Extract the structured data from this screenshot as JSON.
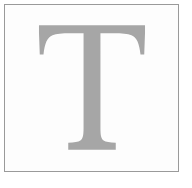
{
  "image": {
    "kind": "letter-specimen",
    "width": 192,
    "height": 188,
    "background_color": "#ffffff"
  },
  "frame": {
    "name": "border-frame",
    "border_color": "#9a9a9a",
    "border_width": 1,
    "fill_color": "#fdfdfd",
    "left": 4,
    "top": 4,
    "width": 175,
    "height": 168
  },
  "glyph": {
    "character": "T",
    "description": "serif capital letter T",
    "color": "#a6a6a6",
    "typeface_style": "serif",
    "bbox": {
      "left": 42,
      "top": 30,
      "right": 150,
      "bottom": 156
    },
    "stem": {
      "left": 86,
      "right": 106,
      "width": 20
    },
    "top_bar": {
      "left": 42,
      "right": 150,
      "top": 30,
      "thickness": 8
    },
    "foot_serif": {
      "left": 68,
      "right": 124,
      "bottom": 156
    }
  }
}
